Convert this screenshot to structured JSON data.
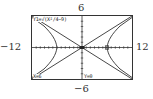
{
  "window": {
    "xmin_label": "−12",
    "xmax_label": "12",
    "ymax_label": "6",
    "ymin_label": "−6",
    "xmin": -12,
    "xmax": 12,
    "ymin": -6,
    "ymax": 6
  },
  "screen": {
    "equation": "Y1=√(X²/4−9)",
    "trace_x": "X=6",
    "trace_y": "Y=0"
  },
  "colors": {
    "curve": "#333333",
    "axis": "#333333",
    "frame": "#333333"
  }
}
